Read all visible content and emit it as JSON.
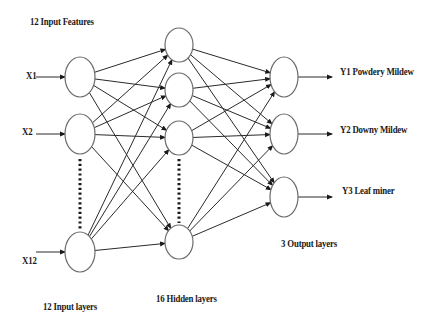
{
  "title": "12 Input Features",
  "inputs": [
    {
      "label": "X1",
      "cx": 80,
      "cy": 77
    },
    {
      "label": "X2",
      "cx": 80,
      "cy": 134
    },
    {
      "label": "X12",
      "cx": 80,
      "cy": 252
    }
  ],
  "hidden": [
    {
      "cx": 179,
      "cy": 45
    },
    {
      "cx": 179,
      "cy": 90
    },
    {
      "cx": 179,
      "cy": 138
    },
    {
      "cx": 179,
      "cy": 242
    }
  ],
  "outputs": [
    {
      "label": "Y1 Powdery Mildew",
      "cx": 284,
      "cy": 77
    },
    {
      "label": "Y2 Downy Mildew",
      "cx": 284,
      "cy": 134
    },
    {
      "label": "Y3 Leaf miner",
      "cx": 284,
      "cy": 197
    }
  ],
  "layer_labels": {
    "input": "12 Input layers",
    "hidden": "16 Hidden layers",
    "output": "3 Output layers"
  },
  "colors": {
    "node_stroke": "#6b6b6b",
    "edge": "#2a2a2a",
    "text": "#1a1a1a",
    "background": "#ffffff"
  }
}
